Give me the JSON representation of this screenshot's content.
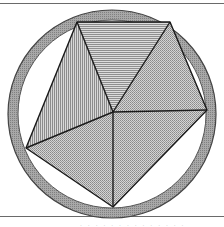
{
  "figure": {
    "colors": {
      "ring_fill": "#9a9a9a",
      "ring_stroke": "#444444",
      "stroke": "#1a1a1a",
      "fill_vertical_hatch": "#c4c4c4",
      "fill_horizontal_hatch": "#c8c8c8",
      "fill_dotted": "#c0c0c0",
      "background": "#ffffff",
      "rule_line": "#6a6a6a"
    },
    "circle": {
      "cx": 112,
      "cy": 114,
      "r_outer": 104,
      "r_inner": 94
    },
    "center_point": {
      "x": 113,
      "y": 112
    },
    "vertices": [
      {
        "name": "top-left",
        "x": 77,
        "y": 22
      },
      {
        "name": "top-right",
        "x": 170,
        "y": 22
      },
      {
        "name": "right",
        "x": 207,
        "y": 110
      },
      {
        "name": "bottom",
        "x": 113,
        "y": 207
      },
      {
        "name": "left",
        "x": 26,
        "y": 148
      }
    ],
    "regions": [
      {
        "name": "top-triangle",
        "pattern": "horizontal-hatch"
      },
      {
        "name": "upper-left-triangle",
        "pattern": "vertical-hatch"
      },
      {
        "name": "upper-right-triangle",
        "pattern": "dotted"
      },
      {
        "name": "lower-left-triangle",
        "pattern": "dotted"
      },
      {
        "name": "lower-right-triangle",
        "pattern": "dotted"
      }
    ],
    "caption": ". . . . .  . . . . . . . . ."
  }
}
